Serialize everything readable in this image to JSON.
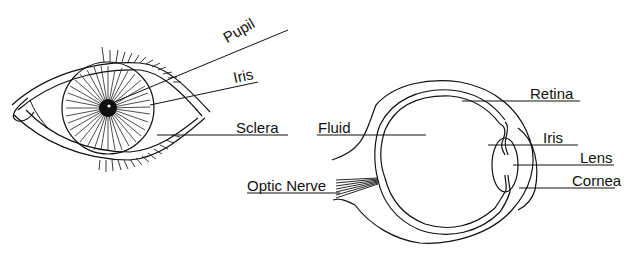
{
  "diagram": {
    "title": "",
    "figures": [
      {
        "id": "front-view",
        "description": "Front view of the human eye with eyelashes",
        "labels": [
          {
            "key": "pupil",
            "text": "Pupil"
          },
          {
            "key": "iris",
            "text": "Iris"
          },
          {
            "key": "sclera",
            "text": "Sclera"
          }
        ]
      },
      {
        "id": "cross-section",
        "description": "Cross-section side view of the human eye",
        "labels": [
          {
            "key": "fluid",
            "text": "Fluid"
          },
          {
            "key": "optic_nerve",
            "text": "Optic Nerve"
          },
          {
            "key": "retina",
            "text": "Retina"
          },
          {
            "key": "iris",
            "text": "Iris"
          },
          {
            "key": "lens",
            "text": "Lens"
          },
          {
            "key": "cornea",
            "text": "Cornea"
          }
        ]
      }
    ]
  },
  "labels": {
    "pupil": "Pupil",
    "front_iris": "Iris",
    "sclera": "Sclera",
    "fluid": "Fluid",
    "optic_nerve": "Optic Nerve",
    "retina": "Retina",
    "side_iris": "Iris",
    "lens": "Lens",
    "cornea": "Cornea"
  },
  "colors": {
    "ink": "#111111",
    "background": "#ffffff"
  }
}
